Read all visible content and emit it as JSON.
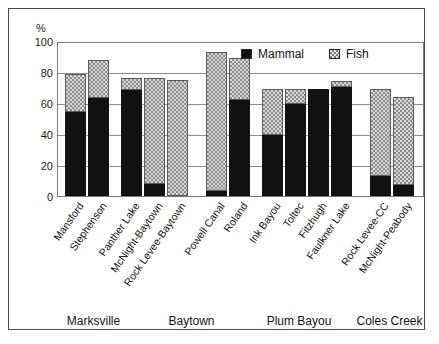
{
  "chart_data": {
    "type": "bar",
    "subtype": "stacked",
    "title": "",
    "ylabel": "%",
    "xlabel": "",
    "ylim": [
      0,
      100
    ],
    "yticks": [
      0,
      20,
      40,
      60,
      80,
      100
    ],
    "grid": true,
    "legend_position": "top-right",
    "legend": [
      "Mammal",
      "Fish"
    ],
    "series": [
      {
        "name": "Mammal",
        "color": "#111111",
        "values": [
          55,
          64,
          69,
          8,
          0,
          3,
          63,
          40,
          60,
          70,
          71,
          13,
          7
        ]
      },
      {
        "name": "Fish",
        "color": "#d9d9d9",
        "values": [
          25,
          25,
          8,
          69,
          76,
          91,
          27,
          30,
          10,
          0,
          4,
          57,
          58
        ]
      }
    ],
    "categories": [
      "Mansford",
      "Stephenson",
      "Panther Lake",
      "McNight-Baytown",
      "Rock Levee-Baytown",
      "Powell Canal",
      "Roland",
      "Ink Bayou",
      "Toltec",
      "Fitzhugh",
      "Faulkner Lake",
      "Rock Levee-CC",
      "McNight-Peabody"
    ],
    "totals": [
      80,
      89,
      77,
      77,
      76,
      94,
      90,
      70,
      70,
      70,
      75,
      70,
      65
    ],
    "groups": [
      {
        "label": "Marksville",
        "categories": [
          "Mansford",
          "Stephenson"
        ]
      },
      {
        "label": "Baytown",
        "categories": [
          "Panther Lake",
          "McNight-Baytown",
          "Rock Levee-Baytown"
        ]
      },
      {
        "label": "Plum Bayou",
        "categories": [
          "Powell Canal",
          "Roland",
          "Ink Bayou",
          "Toltec",
          "Fitzhugh",
          "Faulkner Lake"
        ]
      },
      {
        "label": "Coles Creek",
        "categories": [
          "Rock Levee-CC",
          "McNight-Peabody"
        ]
      }
    ],
    "group_labels": [
      "Marksville",
      "Baytown",
      "Plum Bayou",
      "Coles Creek"
    ]
  },
  "axis": {
    "unit_label": "%",
    "ticks": [
      "100",
      "80",
      "60",
      "40",
      "20",
      "0"
    ]
  },
  "legend": {
    "items": [
      {
        "label": "Mammal",
        "swatch": "mammal-swatch"
      },
      {
        "label": "Fish",
        "swatch": "fish-swatch"
      }
    ]
  },
  "colors": {
    "mammal": "#111111",
    "fish": "#d9d9d9",
    "frame": "#4a4a4a",
    "grid": "#8d8d8d"
  }
}
